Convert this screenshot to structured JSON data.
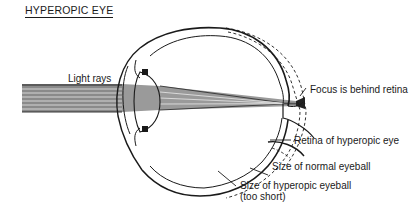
{
  "diagram": {
    "title": "HYPEROPIC EYE",
    "labels": {
      "light_rays": "Light rays",
      "focus": "Focus is behind retina",
      "retina": "Retina of hyperopic eye",
      "normal_size": "Size of normal eyeball",
      "hyperopic_size_line1": "Size of hyperopic eyeball",
      "hyperopic_size_line2": "(too short)"
    },
    "colors": {
      "line": "#1a1a1a",
      "rays": "#555555",
      "background": "#ffffff"
    }
  }
}
